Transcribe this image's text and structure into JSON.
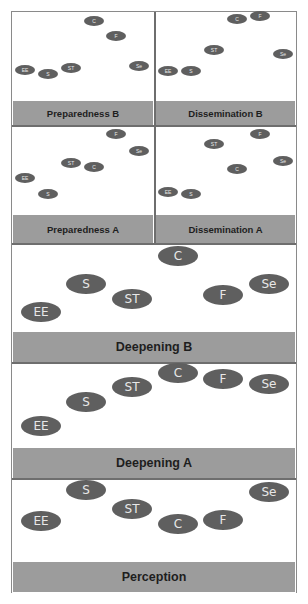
{
  "figure": {
    "panels": [
      {
        "id": "preparedness-b",
        "title": "Preparedness B",
        "nodes": [
          {
            "label": "C",
            "x": 94,
            "y": 21
          },
          {
            "label": "F",
            "x": 116,
            "y": 36
          },
          {
            "label": "EE",
            "x": 25,
            "y": 70
          },
          {
            "label": "S",
            "x": 48,
            "y": 74
          },
          {
            "label": "ST",
            "x": 71,
            "y": 68
          },
          {
            "label": "Se",
            "x": 139,
            "y": 66
          }
        ]
      },
      {
        "id": "dissemination-b",
        "title": "Dissemination B",
        "nodes": [
          {
            "label": "C",
            "x": 237,
            "y": 19
          },
          {
            "label": "F",
            "x": 260,
            "y": 16
          },
          {
            "label": "ST",
            "x": 214,
            "y": 50
          },
          {
            "label": "Se",
            "x": 283,
            "y": 54
          },
          {
            "label": "EE",
            "x": 168,
            "y": 71
          },
          {
            "label": "S",
            "x": 191,
            "y": 71
          }
        ]
      },
      {
        "id": "preparedness-a",
        "title": "Preparedness A",
        "nodes": [
          {
            "label": "F",
            "x": 116,
            "y": 134
          },
          {
            "label": "Se",
            "x": 139,
            "y": 151
          },
          {
            "label": "ST",
            "x": 71,
            "y": 163
          },
          {
            "label": "C",
            "x": 94,
            "y": 167
          },
          {
            "label": "EE",
            "x": 25,
            "y": 178
          },
          {
            "label": "S",
            "x": 48,
            "y": 194
          }
        ]
      },
      {
        "id": "dissemination-a",
        "title": "Dissemination A",
        "nodes": [
          {
            "label": "F",
            "x": 260,
            "y": 134
          },
          {
            "label": "ST",
            "x": 214,
            "y": 144
          },
          {
            "label": "Se",
            "x": 283,
            "y": 161
          },
          {
            "label": "C",
            "x": 237,
            "y": 169
          },
          {
            "label": "EE",
            "x": 168,
            "y": 192
          },
          {
            "label": "S",
            "x": 191,
            "y": 194
          }
        ]
      },
      {
        "id": "deepening-b",
        "title": "Deepening B",
        "nodes": [
          {
            "label": "C",
            "x": 178,
            "y": 256
          },
          {
            "label": "S",
            "x": 86,
            "y": 284
          },
          {
            "label": "Se",
            "x": 269,
            "y": 284
          },
          {
            "label": "ST",
            "x": 132,
            "y": 299
          },
          {
            "label": "F",
            "x": 223,
            "y": 295
          },
          {
            "label": "EE",
            "x": 41,
            "y": 312
          }
        ]
      },
      {
        "id": "deepening-a",
        "title": "Deepening A",
        "nodes": [
          {
            "label": "C",
            "x": 178,
            "y": 373
          },
          {
            "label": "F",
            "x": 223,
            "y": 379
          },
          {
            "label": "Se",
            "x": 269,
            "y": 384
          },
          {
            "label": "ST",
            "x": 132,
            "y": 387
          },
          {
            "label": "S",
            "x": 86,
            "y": 402
          },
          {
            "label": "EE",
            "x": 41,
            "y": 426
          }
        ]
      },
      {
        "id": "perception",
        "title": "Perception",
        "nodes": [
          {
            "label": "S",
            "x": 86,
            "y": 490
          },
          {
            "label": "Se",
            "x": 269,
            "y": 492
          },
          {
            "label": "ST",
            "x": 132,
            "y": 509
          },
          {
            "label": "EE",
            "x": 41,
            "y": 521
          },
          {
            "label": "C",
            "x": 178,
            "y": 524
          },
          {
            "label": "F",
            "x": 223,
            "y": 520
          }
        ]
      }
    ]
  },
  "colors": {
    "node_fill": "#5f5f5f",
    "node_text": "#e8e8e8",
    "label_bar": "#9c9c9c",
    "label_text": "#1e1e1e",
    "border": "#6e6e6e"
  }
}
